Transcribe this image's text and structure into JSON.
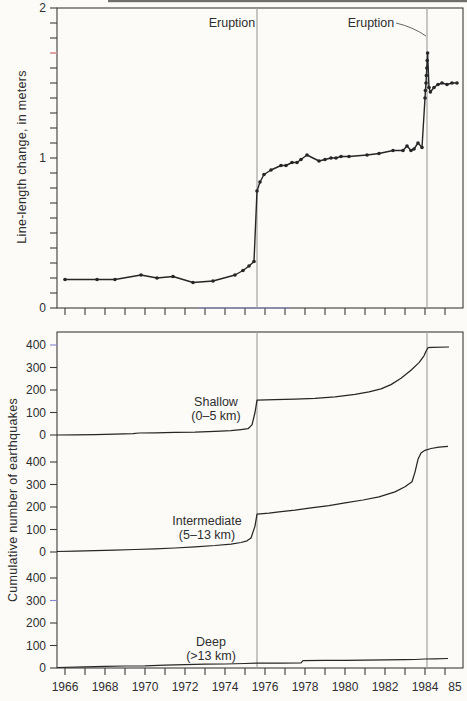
{
  "figure": {
    "colors": {
      "background": "#fcfbf8",
      "ink": "#262626",
      "frame": "#3c3c3c",
      "tick": "#3c3c3c",
      "text": "#2e2e2e",
      "eruption_line": "#a3a3a3",
      "pointer": "#555555",
      "red_tick": "#d98c8c",
      "blue_artifact": "#8585cd",
      "scan_edge": "#3f3f3f"
    }
  },
  "chart_data": [
    {
      "id": "line-length-change",
      "type": "line",
      "ylabel": "Line-length change, in meters",
      "ylim": [
        0,
        2
      ],
      "yticks": [
        {
          "value": 0,
          "label": "0"
        },
        {
          "value": 1,
          "label": "1"
        },
        {
          "value": 2,
          "label": "2"
        }
      ],
      "minor_ytick_step": 0.1,
      "red_axis_tick_value": 1.7,
      "xlim": [
        1965.6,
        1985.9
      ],
      "xtick_years": [
        1966,
        1967,
        1968,
        1969,
        1970,
        1971,
        1972,
        1973,
        1974,
        1975,
        1976,
        1977,
        1978,
        1979,
        1980,
        1981,
        1982,
        1983,
        1984,
        1985
      ],
      "annotations": [
        {
          "text": "Eruption",
          "year": 1975.6,
          "has_pointer": false
        },
        {
          "text": "Eruption",
          "year": 1984.1,
          "has_pointer": true
        }
      ],
      "series": [
        {
          "name": "line-length change",
          "marker": "circle",
          "points": [
            [
              1966.0,
              0.19
            ],
            [
              1967.6,
              0.19
            ],
            [
              1968.5,
              0.19
            ],
            [
              1969.8,
              0.22
            ],
            [
              1970.6,
              0.2
            ],
            [
              1971.4,
              0.21
            ],
            [
              1972.4,
              0.17
            ],
            [
              1973.4,
              0.18
            ],
            [
              1974.5,
              0.22
            ],
            [
              1974.9,
              0.25
            ],
            [
              1975.2,
              0.28
            ],
            [
              1975.45,
              0.31
            ],
            [
              1975.6,
              0.78
            ],
            [
              1975.75,
              0.84
            ],
            [
              1975.95,
              0.89
            ],
            [
              1976.3,
              0.92
            ],
            [
              1976.8,
              0.95
            ],
            [
              1977.05,
              0.95
            ],
            [
              1977.35,
              0.97
            ],
            [
              1977.6,
              0.97
            ],
            [
              1977.8,
              0.99
            ],
            [
              1978.1,
              1.02
            ],
            [
              1978.7,
              0.98
            ],
            [
              1979.0,
              0.99
            ],
            [
              1979.3,
              1.0
            ],
            [
              1979.55,
              1.0
            ],
            [
              1979.8,
              1.01
            ],
            [
              1980.2,
              1.01
            ],
            [
              1981.1,
              1.02
            ],
            [
              1981.7,
              1.03
            ],
            [
              1982.4,
              1.05
            ],
            [
              1982.9,
              1.05
            ],
            [
              1983.1,
              1.08
            ],
            [
              1983.3,
              1.05
            ],
            [
              1983.45,
              1.06
            ],
            [
              1983.65,
              1.1
            ],
            [
              1983.85,
              1.07
            ],
            [
              1984.0,
              1.4
            ],
            [
              1984.02,
              1.45
            ],
            [
              1984.05,
              1.5
            ],
            [
              1984.07,
              1.55
            ],
            [
              1984.09,
              1.6
            ],
            [
              1984.11,
              1.65
            ],
            [
              1984.13,
              1.7
            ],
            [
              1984.2,
              1.47
            ],
            [
              1984.27,
              1.44
            ],
            [
              1984.45,
              1.47
            ],
            [
              1984.65,
              1.49
            ],
            [
              1984.85,
              1.5
            ],
            [
              1985.1,
              1.49
            ],
            [
              1985.35,
              1.5
            ],
            [
              1985.6,
              1.5
            ]
          ]
        }
      ]
    },
    {
      "id": "cumulative-earthquakes",
      "type": "line",
      "ylabel": "Cumulative number of earthquakes",
      "section_ylim": [
        0,
        400
      ],
      "yticks": [
        {
          "value": 0,
          "label": "0"
        },
        {
          "value": 100,
          "label": "100"
        },
        {
          "value": 200,
          "label": "200"
        },
        {
          "value": 300,
          "label": "300"
        },
        {
          "value": 400,
          "label": "400"
        }
      ],
      "xtick_years": [
        1966,
        1967,
        1968,
        1969,
        1970,
        1971,
        1972,
        1973,
        1974,
        1975,
        1976,
        1977,
        1978,
        1979,
        1980,
        1981,
        1982,
        1983,
        1984,
        1985
      ],
      "xtick_labels": [
        {
          "year": 1966,
          "text": "1966"
        },
        {
          "year": 1968,
          "text": "1968"
        },
        {
          "year": 1970,
          "text": "1970"
        },
        {
          "year": 1972,
          "text": "1972"
        },
        {
          "year": 1974,
          "text": "1974"
        },
        {
          "year": 1976,
          "text": "1976"
        },
        {
          "year": 1978,
          "text": "1978"
        },
        {
          "year": 1980,
          "text": "1980"
        },
        {
          "year": 1982,
          "text": "1982"
        },
        {
          "year": 1984,
          "text": "1984"
        },
        {
          "year": 1985,
          "text": "85"
        }
      ],
      "sections": [
        {
          "name": "shallow",
          "label_lines": [
            "Shallow",
            "(0–5 km)"
          ],
          "points": [
            [
              1965.6,
              0
            ],
            [
              1966.5,
              1
            ],
            [
              1967.5,
              2
            ],
            [
              1968.5,
              4
            ],
            [
              1969.4,
              6
            ],
            [
              1969.7,
              9
            ],
            [
              1970.5,
              10
            ],
            [
              1971.5,
              12
            ],
            [
              1972.5,
              13
            ],
            [
              1973.5,
              16
            ],
            [
              1974.3,
              19
            ],
            [
              1974.8,
              24
            ],
            [
              1975.15,
              28
            ],
            [
              1975.35,
              45
            ],
            [
              1975.5,
              100
            ],
            [
              1975.6,
              155
            ],
            [
              1976.5,
              157
            ],
            [
              1977.5,
              159
            ],
            [
              1978.5,
              163
            ],
            [
              1979.5,
              170
            ],
            [
              1980.5,
              181
            ],
            [
              1981.2,
              192
            ],
            [
              1981.8,
              205
            ],
            [
              1982.3,
              224
            ],
            [
              1982.8,
              252
            ],
            [
              1983.3,
              288
            ],
            [
              1983.7,
              322
            ],
            [
              1983.95,
              352
            ],
            [
              1984.05,
              372
            ],
            [
              1984.15,
              388
            ],
            [
              1984.35,
              390
            ],
            [
              1985.2,
              391
            ]
          ]
        },
        {
          "name": "intermediate",
          "label_lines": [
            "Intermediate",
            "(5–13 km)"
          ],
          "points": [
            [
              1965.6,
              2
            ],
            [
              1966.5,
              4
            ],
            [
              1967.5,
              6
            ],
            [
              1968.5,
              8
            ],
            [
              1969.5,
              11
            ],
            [
              1970.5,
              14
            ],
            [
              1971.5,
              18
            ],
            [
              1972.5,
              23
            ],
            [
              1973.5,
              29
            ],
            [
              1974.3,
              35
            ],
            [
              1974.8,
              42
            ],
            [
              1975.1,
              50
            ],
            [
              1975.3,
              62
            ],
            [
              1975.5,
              115
            ],
            [
              1975.6,
              168
            ],
            [
              1976.2,
              173
            ],
            [
              1976.7,
              178
            ],
            [
              1977.5,
              186
            ],
            [
              1978.3,
              196
            ],
            [
              1979.2,
              206
            ],
            [
              1980.0,
              218
            ],
            [
              1980.9,
              231
            ],
            [
              1981.7,
              245
            ],
            [
              1982.5,
              267
            ],
            [
              1983.0,
              290
            ],
            [
              1983.35,
              312
            ],
            [
              1983.5,
              355
            ],
            [
              1983.65,
              412
            ],
            [
              1983.8,
              440
            ],
            [
              1984.0,
              452
            ],
            [
              1984.3,
              460
            ],
            [
              1984.7,
              466
            ],
            [
              1985.15,
              470
            ]
          ]
        },
        {
          "name": "deep",
          "label_lines": [
            "Deep",
            "(>13 km)"
          ],
          "points": [
            [
              1965.6,
              2
            ],
            [
              1967.0,
              5
            ],
            [
              1968.0,
              7
            ],
            [
              1969.0,
              9
            ],
            [
              1970.0,
              10
            ],
            [
              1971.0,
              13
            ],
            [
              1972.0,
              15
            ],
            [
              1973.0,
              17
            ],
            [
              1974.0,
              18
            ],
            [
              1975.0,
              20
            ],
            [
              1975.7,
              22
            ],
            [
              1976.8,
              22
            ],
            [
              1977.8,
              23
            ],
            [
              1977.9,
              33
            ],
            [
              1979.0,
              34
            ],
            [
              1980.0,
              34
            ],
            [
              1981.0,
              35
            ],
            [
              1982.0,
              36
            ],
            [
              1983.0,
              37
            ],
            [
              1983.5,
              38
            ],
            [
              1984.0,
              40
            ],
            [
              1984.5,
              41
            ],
            [
              1985.15,
              42
            ]
          ]
        }
      ]
    }
  ]
}
